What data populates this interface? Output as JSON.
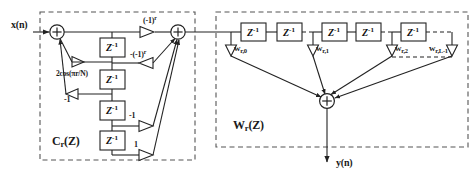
{
  "figure": {
    "input_label": "x(n)",
    "output_label": "y(n)",
    "stroke_color": "#222222",
    "dash_color": "#555555",
    "background": "#ffffff"
  },
  "blocks": {
    "left": {
      "name_base": "C",
      "name_sub": "r",
      "name_tail": "(Z)",
      "label": "Cr(Z)"
    },
    "right": {
      "name_base": "W",
      "name_sub": "r",
      "name_tail": "(Z)",
      "label": "Wr(Z)"
    }
  },
  "delay_elements": {
    "symbol_base": "Z",
    "symbol_exp": "-1",
    "left_count": 4,
    "right_count": 5
  },
  "left_coefficients": [
    {
      "id": "c-top",
      "text": "(-1)",
      "sup": "r"
    },
    {
      "id": "c-neg-top",
      "text": "-(-1)",
      "sup": "r"
    },
    {
      "id": "c-cos",
      "text": "2cos(πr/N)",
      "sup": ""
    },
    {
      "id": "c-neg-one-a",
      "text": "-1",
      "sup": ""
    },
    {
      "id": "c-neg-one-b",
      "text": "-1",
      "sup": ""
    },
    {
      "id": "c-one",
      "text": "1",
      "sup": ""
    }
  ],
  "right_weights": [
    {
      "id": "w0",
      "base": "w",
      "sub": "r,0"
    },
    {
      "id": "w1",
      "base": "w",
      "sub": "r,1"
    },
    {
      "id": "w2",
      "base": "w",
      "sub": "r,2"
    },
    {
      "id": "wL",
      "base": "w",
      "sub": "r,L-1"
    }
  ],
  "adders": [
    {
      "id": "adder-input",
      "symbol": "+"
    },
    {
      "id": "adder-mid",
      "symbol": "+"
    },
    {
      "id": "adder-output",
      "symbol": "+"
    }
  ],
  "icons": {
    "gain_triangle": "triangle-gain-icon",
    "adder": "circle-plus-icon",
    "arrow": "arrowhead-icon"
  }
}
